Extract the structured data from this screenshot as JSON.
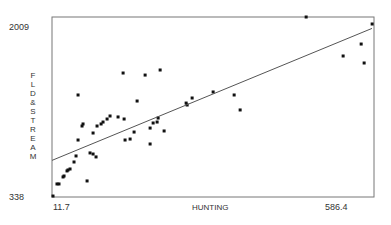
{
  "chart_data": {
    "type": "scatter",
    "title": "",
    "xlabel": "HUNTING",
    "ylabel": "FLD&STREAM",
    "xlim": [
      11.7,
      586.4
    ],
    "ylim": [
      338,
      2009
    ],
    "x_tick_labels": [
      "11.7",
      "586.4"
    ],
    "y_tick_labels": [
      "2009",
      "338"
    ],
    "grid": false,
    "legend": "none",
    "points": [
      {
        "x": 13.5,
        "y": 347
      },
      {
        "x": 20.6,
        "y": 459
      },
      {
        "x": 24.2,
        "y": 459
      },
      {
        "x": 31.4,
        "y": 524
      },
      {
        "x": 33.2,
        "y": 533
      },
      {
        "x": 38.5,
        "y": 580
      },
      {
        "x": 40.3,
        "y": 589
      },
      {
        "x": 43.9,
        "y": 598
      },
      {
        "x": 51.0,
        "y": 663
      },
      {
        "x": 54.6,
        "y": 719
      },
      {
        "x": 58.2,
        "y": 867
      },
      {
        "x": 58.2,
        "y": 1285
      },
      {
        "x": 65.3,
        "y": 997
      },
      {
        "x": 67.1,
        "y": 1016
      },
      {
        "x": 74.3,
        "y": 487
      },
      {
        "x": 79.6,
        "y": 747
      },
      {
        "x": 85.0,
        "y": 737
      },
      {
        "x": 85.0,
        "y": 932
      },
      {
        "x": 90.3,
        "y": 710
      },
      {
        "x": 92.1,
        "y": 997
      },
      {
        "x": 99.3,
        "y": 1016
      },
      {
        "x": 102.8,
        "y": 1034
      },
      {
        "x": 110.0,
        "y": 1062
      },
      {
        "x": 115.3,
        "y": 1090
      },
      {
        "x": 129.6,
        "y": 1081
      },
      {
        "x": 138.6,
        "y": 1489
      },
      {
        "x": 140.4,
        "y": 1062
      },
      {
        "x": 142.1,
        "y": 867
      },
      {
        "x": 151.1,
        "y": 876
      },
      {
        "x": 158.2,
        "y": 941
      },
      {
        "x": 163.6,
        "y": 1229
      },
      {
        "x": 177.9,
        "y": 1470
      },
      {
        "x": 186.8,
        "y": 978
      },
      {
        "x": 186.8,
        "y": 830
      },
      {
        "x": 192.2,
        "y": 1025
      },
      {
        "x": 199.3,
        "y": 1034
      },
      {
        "x": 201.1,
        "y": 1071
      },
      {
        "x": 204.7,
        "y": 1517
      },
      {
        "x": 211.8,
        "y": 951
      },
      {
        "x": 251.1,
        "y": 1210
      },
      {
        "x": 252.9,
        "y": 1192
      },
      {
        "x": 261.8,
        "y": 1257
      },
      {
        "x": 299.3,
        "y": 1313
      },
      {
        "x": 336.8,
        "y": 1285
      },
      {
        "x": 347.5,
        "y": 1146
      },
      {
        "x": 465.3,
        "y": 2009
      },
      {
        "x": 531.3,
        "y": 1647
      },
      {
        "x": 563.5,
        "y": 1758
      },
      {
        "x": 568.8,
        "y": 1582
      },
      {
        "x": 583.1,
        "y": 1944
      }
    ],
    "regression_line": {
      "x": [
        11.7,
        582.8
      ],
      "y": [
        678,
        1903
      ]
    }
  }
}
